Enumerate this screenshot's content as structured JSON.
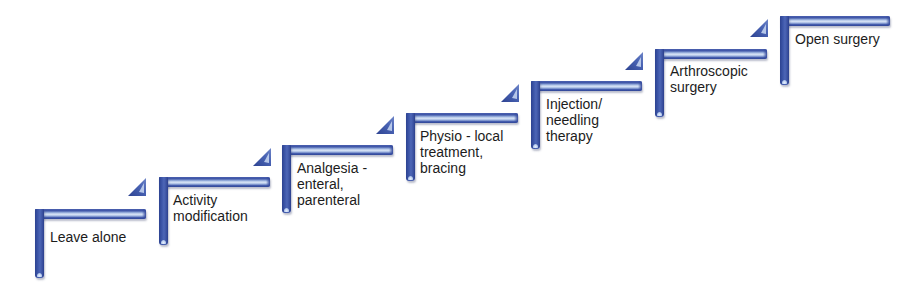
{
  "diagram": {
    "type": "staircase",
    "colors": {
      "bar_dark": "#3f56a8",
      "bar_highlight": "#dbe6f7",
      "text": "#1c1c1c",
      "background": "#ffffff"
    },
    "steps": [
      {
        "order": 1,
        "label": "Leave alone"
      },
      {
        "order": 2,
        "label": "Activity\nmodification"
      },
      {
        "order": 3,
        "label": "Analgesia -\nenteral,\nparenteral"
      },
      {
        "order": 4,
        "label": "Physio - local\ntreatment,\nbracing"
      },
      {
        "order": 5,
        "label": "Injection/\nneedling\ntherapy"
      },
      {
        "order": 6,
        "label": "Arthroscopic\nsurgery"
      },
      {
        "order": 7,
        "label": "Open surgery"
      }
    ],
    "connector_icon": "triangle-arrow-icon"
  }
}
